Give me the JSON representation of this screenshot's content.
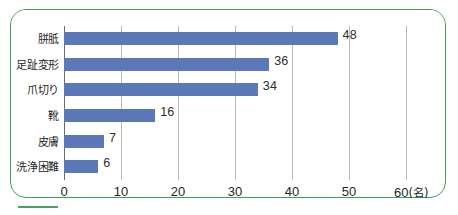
{
  "chart_data": {
    "type": "bar",
    "orientation": "horizontal",
    "title": "",
    "subtitle": "",
    "xlabel": "",
    "ylabel": "",
    "unit_label": "(名)",
    "categories": [
      "胼胝",
      "足趾変形",
      "爪切り",
      "靴",
      "皮膚",
      "洗浄困難"
    ],
    "values": [
      48,
      36,
      34,
      16,
      7,
      6
    ],
    "value_labels": [
      "48",
      "36",
      "34",
      "16",
      "7",
      "6"
    ],
    "xlim": [
      0,
      60
    ],
    "xticks": [
      0,
      10,
      20,
      30,
      40,
      50,
      60
    ],
    "xtick_labels": [
      "0",
      "10",
      "20",
      "30",
      "40",
      "50",
      "60"
    ],
    "grid": true,
    "legend": null,
    "series": [
      {
        "name": "人数",
        "values": [
          48,
          36,
          34,
          16,
          7,
          6
        ]
      }
    ]
  },
  "style": {
    "bar_color": "#5c78b8",
    "frame_color": "#3e9e57",
    "gridline_color": "#b9b9b9",
    "axis_color": "#6b6b6b",
    "text_color": "#1f1f1f",
    "background": "#ffffff"
  }
}
